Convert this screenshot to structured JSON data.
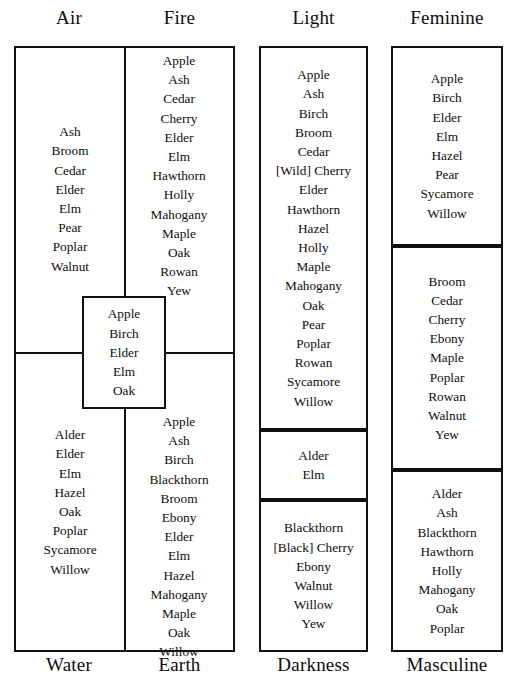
{
  "figure": {
    "kind": "correspondence-table",
    "ink_color": "#111111",
    "background": "#ffffff"
  },
  "groups": [
    {
      "id": "elements",
      "header_left": "Air",
      "header_right": "Fire",
      "footer_left": "Water",
      "footer_right": "Earth",
      "quadrants": {
        "air": [
          "Ash",
          "Broom",
          "Cedar",
          "Elder",
          "Elm",
          "Pear",
          "Poplar",
          "Walnut"
        ],
        "fire": [
          "Apple",
          "Ash",
          "Cedar",
          "Cherry",
          "Elder",
          "Elm",
          "Hawthorn",
          "Holly",
          "Mahogany",
          "Maple",
          "Oak",
          "Rowan",
          "Yew"
        ],
        "water": [
          "Alder",
          "Elder",
          "Elm",
          "Hazel",
          "Oak",
          "Poplar",
          "Sycamore",
          "Willow"
        ],
        "earth": [
          "Apple",
          "Ash",
          "Birch",
          "Blackthorn",
          "Broom",
          "Ebony",
          "Elder",
          "Elm",
          "Hazel",
          "Mahogany",
          "Maple",
          "Oak",
          "Willow"
        ]
      },
      "center_overlap": [
        "Apple",
        "Birch",
        "Elder",
        "Elm",
        "Oak"
      ]
    },
    {
      "id": "light-darkness",
      "header": "Light",
      "footer": "Darkness",
      "sections": [
        [
          "Apple",
          "Ash",
          "Birch",
          "Broom",
          "Cedar",
          "[Wild] Cherry",
          "Elder",
          "Hawthorn",
          "Hazel",
          "Holly",
          "Maple",
          "Mahogany",
          "Oak",
          "Pear",
          "Poplar",
          "Rowan",
          "Sycamore",
          "Willow"
        ],
        [
          "Alder",
          "Elm"
        ],
        [
          "Blackthorn",
          "[Black] Cherry",
          "Ebony",
          "Walnut",
          "Willow",
          "Yew"
        ]
      ]
    },
    {
      "id": "feminine-masculine",
      "header": "Feminine",
      "footer": "Masculine",
      "sections": [
        [
          "Apple",
          "Birch",
          "Elder",
          "Elm",
          "Hazel",
          "Pear",
          "Sycamore",
          "Willow"
        ],
        [
          "Broom",
          "Cedar",
          "Cherry",
          "Ebony",
          "Maple",
          "Poplar",
          "Rowan",
          "Walnut",
          "Yew"
        ],
        [
          "Alder",
          "Ash",
          "Blackthorn",
          "Hawthorn",
          "Holly",
          "Mahogany",
          "Oak",
          "Poplar"
        ]
      ]
    }
  ]
}
